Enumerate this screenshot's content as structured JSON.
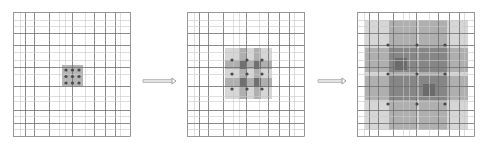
{
  "canvas": {
    "width": 482,
    "height": 148,
    "background": "#ffffff"
  },
  "colors": {
    "grid_major": "#6e6e6e",
    "grid_minor": "#c8c8c8",
    "border": "#9a9a9a",
    "dot": "#4a4a4a",
    "shade_light": "#cfcfcf",
    "shade_mid": "#a8a8a8",
    "shade_dark": "#808080",
    "shade_darker": "#666666",
    "arrow": "#8a8a8a"
  },
  "grid_template": {
    "x_offsets": [
      0,
      7,
      12,
      21,
      36,
      46,
      52,
      59,
      72,
      81,
      92,
      102,
      107,
      117
    ],
    "x_major": [
      0,
      12,
      21,
      36,
      59,
      81,
      92,
      102,
      117
    ],
    "y_offsets": [
      0,
      8,
      14,
      21,
      33,
      40,
      48,
      55,
      62,
      74,
      84,
      89,
      98,
      104,
      111,
      117,
      124
    ],
    "y_major": [
      0,
      21,
      33,
      55,
      74,
      98,
      111,
      124
    ],
    "width": 117,
    "height": 124
  },
  "panels": [
    {
      "id": "panel-1",
      "label": "Initial state: 3x3 point cluster",
      "x": 13,
      "y": 12,
      "shades": [
        {
          "x": 49,
          "y": 53,
          "w": 21,
          "h": 21,
          "tone": "shade_mid"
        }
      ],
      "dots": {
        "cx": [
          53,
          59.5,
          66
        ],
        "cy": [
          58,
          64.5,
          71
        ],
        "r": 1.6
      }
    },
    {
      "id": "panel-2",
      "label": "First expansion: checkerboard neighborhoods",
      "x": 187,
      "y": 12,
      "shades": [
        {
          "x": 38,
          "y": 36,
          "w": 47,
          "h": 51,
          "tone": "shade_light"
        },
        {
          "x": 38,
          "y": 48,
          "w": 47,
          "h": 9,
          "tone": "shade_mid"
        },
        {
          "x": 38,
          "y": 66,
          "w": 47,
          "h": 9,
          "tone": "shade_mid"
        },
        {
          "x": 52,
          "y": 36,
          "w": 7,
          "h": 51,
          "tone": "shade_mid"
        },
        {
          "x": 67,
          "y": 36,
          "w": 7,
          "h": 51,
          "tone": "shade_mid"
        },
        {
          "x": 52,
          "y": 48,
          "w": 7,
          "h": 9,
          "tone": "shade_darker"
        },
        {
          "x": 67,
          "y": 48,
          "w": 7,
          "h": 9,
          "tone": "shade_darker"
        },
        {
          "x": 52,
          "y": 66,
          "w": 7,
          "h": 9,
          "tone": "shade_darker"
        },
        {
          "x": 67,
          "y": 66,
          "w": 7,
          "h": 9,
          "tone": "shade_darker"
        }
      ],
      "dots": {
        "cx": [
          45,
          60,
          75
        ],
        "cy": [
          48,
          62,
          77
        ],
        "r": 1.6
      }
    },
    {
      "id": "panel-3",
      "label": "Second expansion: overlapping bands",
      "x": 357,
      "y": 12,
      "shades": [
        {
          "x": 8,
          "y": 8,
          "w": 103,
          "h": 110,
          "tone": "shade_light"
        },
        {
          "x": 8,
          "y": 36,
          "w": 103,
          "h": 24,
          "tone": "shade_mid"
        },
        {
          "x": 8,
          "y": 64,
          "w": 103,
          "h": 24,
          "tone": "shade_mid"
        },
        {
          "x": 32,
          "y": 8,
          "w": 28,
          "h": 110,
          "tone": "shade_mid"
        },
        {
          "x": 62,
          "y": 8,
          "w": 28,
          "h": 110,
          "tone": "shade_mid"
        },
        {
          "x": 32,
          "y": 36,
          "w": 28,
          "h": 24,
          "tone": "shade_dark"
        },
        {
          "x": 62,
          "y": 36,
          "w": 28,
          "h": 24,
          "tone": "shade_dark"
        },
        {
          "x": 32,
          "y": 64,
          "w": 28,
          "h": 24,
          "tone": "shade_dark"
        },
        {
          "x": 62,
          "y": 64,
          "w": 28,
          "h": 24,
          "tone": "shade_dark"
        },
        {
          "x": 38,
          "y": 46,
          "w": 12,
          "h": 12,
          "tone": "shade_darker"
        },
        {
          "x": 66,
          "y": 72,
          "w": 12,
          "h": 12,
          "tone": "shade_darker"
        }
      ],
      "dots": {
        "cx": [
          31,
          60,
          88
        ],
        "cy": [
          33,
          62,
          92
        ],
        "r": 1.6
      }
    }
  ],
  "arrows": [
    {
      "id": "arrow-1",
      "x1": 143,
      "x2": 176,
      "y": 81
    },
    {
      "id": "arrow-2",
      "x1": 318,
      "x2": 346,
      "y": 81
    }
  ]
}
